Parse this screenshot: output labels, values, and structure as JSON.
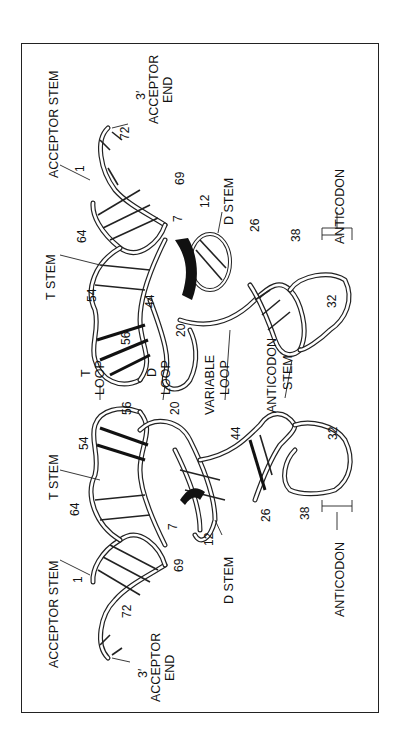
{
  "figure": {
    "views": [
      {
        "name": "upper",
        "labels": {
          "acceptor_stem": "ACCEPTOR STEM",
          "acceptor_end_prime": "3′",
          "acceptor_end_1": "ACCEPTOR",
          "acceptor_end_2": "END",
          "t_stem": "T STEM",
          "t_loop_1": "T",
          "t_loop_2": "LOOP",
          "d_loop_1": "D",
          "d_loop_2": "LOOP",
          "d_stem": "D STEM",
          "variable_loop_1": "VARIABLE",
          "variable_loop_2": "LOOP",
          "anticodon_stem_1": "ANTICODON",
          "anticodon_stem_2": "STEM",
          "anticodon": "ANTICODON"
        },
        "numbers": {
          "n1": "1",
          "n72": "72",
          "n69": "69",
          "n64": "64",
          "n7": "7",
          "n12": "12",
          "n26": "26",
          "n38": "38",
          "n54": "54",
          "n56": "56",
          "n20": "20",
          "n44": "44",
          "n32": "32"
        }
      },
      {
        "name": "lower",
        "labels": {
          "acceptor_stem": "ACCEPTOR STEM",
          "acceptor_end_prime": "3′",
          "acceptor_end_1": "ACCEPTOR",
          "acceptor_end_2": "END",
          "t_stem": "T STEM",
          "d_stem": "D STEM",
          "anticodon": "ANTICODON"
        },
        "numbers": {
          "n1": "1",
          "n72": "72",
          "n69": "69",
          "n64": "64",
          "n7": "7",
          "n12": "12",
          "n26": "26",
          "n38": "38",
          "n54": "54",
          "n56": "56",
          "n20": "20",
          "n44": "44",
          "n32": "32"
        }
      }
    ]
  }
}
